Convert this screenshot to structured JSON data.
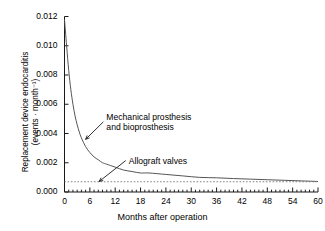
{
  "chart_data": {
    "type": "line",
    "title": "",
    "xlabel": "Months after operation",
    "ylabel_line1": "Replacement device endocarditis",
    "ylabel_line2": "(events · month⁻¹)",
    "xlim": [
      0,
      60
    ],
    "ylim": [
      0,
      0.012
    ],
    "xticks": [
      0,
      6,
      12,
      18,
      24,
      30,
      36,
      42,
      48,
      54,
      60
    ],
    "xtick_labels": [
      "0",
      "6",
      "12",
      "18",
      "24",
      "30",
      "36",
      "42",
      "48",
      "54",
      "60"
    ],
    "x_minor_tick_step": 1,
    "yticks": [
      0.0,
      0.002,
      0.004,
      0.006,
      0.008,
      0.01,
      0.012
    ],
    "ytick_labels": [
      "0.000",
      "0.002",
      "0.004",
      "0.006",
      "0.008",
      "0.010",
      "0.012"
    ],
    "grid": false,
    "legend_position": "none",
    "frame": "left-and-bottom-only",
    "series": [
      {
        "name": "Mechanical prosthesis and bioprosthesis",
        "style": "solid",
        "color": "#555555",
        "x": [
          0,
          0.5,
          1,
          1.5,
          2,
          2.5,
          3,
          3.5,
          4,
          5,
          6,
          7,
          8,
          9,
          10,
          12,
          14,
          16,
          18,
          20,
          24,
          28,
          32,
          36,
          40,
          44,
          48,
          52,
          56,
          60
        ],
        "y": [
          0.0118,
          0.01,
          0.0083,
          0.007,
          0.006,
          0.0052,
          0.0046,
          0.0041,
          0.0037,
          0.0031,
          0.0027,
          0.0024,
          0.0022,
          0.002,
          0.0019,
          0.0017,
          0.0015,
          0.0014,
          0.0013,
          0.0013,
          0.0012,
          0.0011,
          0.001,
          0.00097,
          0.00092,
          0.00088,
          0.00084,
          0.0008,
          0.00076,
          0.00072
        ]
      },
      {
        "name": "Allograft valves",
        "style": "dotted",
        "color": "#777777",
        "x": [
          0,
          60
        ],
        "y": [
          0.0007,
          0.0007
        ]
      }
    ],
    "annotations": [
      {
        "id": "mechanical",
        "line1": "Mechanical prosthesis",
        "line2": "and bioprosthesis",
        "arrow_from": [
          9.2,
          0.0048
        ],
        "arrow_to": [
          5.0,
          0.0036
        ]
      },
      {
        "id": "allograft",
        "line1": "Allograft valves",
        "line2": "",
        "arrow_from": [
          14.5,
          0.00215
        ],
        "arrow_to": [
          8.2,
          0.00072
        ]
      }
    ]
  }
}
